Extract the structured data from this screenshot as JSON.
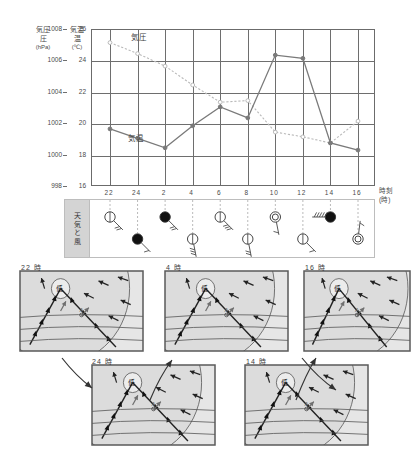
{
  "chart_data": {
    "type": "line",
    "title": "",
    "xlabel": "時刻",
    "xlabel_unit": "(時)",
    "categories": [
      "22",
      "24",
      "2",
      "4",
      "6",
      "8",
      "10",
      "12",
      "14",
      "16"
    ],
    "grid": true,
    "legend": "inline-annotation",
    "axes": [
      {
        "id": "pressure",
        "name": "気圧",
        "unit": "(hPa)",
        "ylim": [
          998,
          1008
        ],
        "ticks": [
          998,
          1000,
          1002,
          1004,
          1006,
          1008
        ],
        "side": "left-outer"
      },
      {
        "id": "temperature",
        "name": "気温",
        "unit": "(℃)",
        "ylim": [
          16,
          26
        ],
        "ticks": [
          16,
          18,
          20,
          22,
          24,
          26
        ],
        "side": "left-inner"
      }
    ],
    "series": [
      {
        "name": "気圧",
        "axis": "pressure",
        "style": "dotted",
        "marker": "open-circle",
        "color": "#b9b9b9",
        "values": [
          1007.2,
          1006.5,
          1005.7,
          1004.5,
          1003.4,
          1003.5,
          1001.5,
          1001.2,
          1000.8,
          1002.2
        ]
      },
      {
        "name": "気温",
        "axis": "temperature",
        "style": "solid",
        "marker": "filled-circle",
        "color": "#7a7a7a",
        "values": [
          19.7,
          19.1,
          18.5,
          19.9,
          21.1,
          20.4,
          24.4,
          24.2,
          18.8,
          18.35
        ]
      }
    ],
    "annotations": [
      {
        "text": "気圧",
        "near_x": "24",
        "position": "upper-left"
      },
      {
        "text": "気温",
        "near_x": "24",
        "position": "lower-left"
      }
    ]
  },
  "weather_band": {
    "label": "天気と風",
    "entries": [
      {
        "time": "22",
        "sky": "clear-circle",
        "sky_glyph": "open-circle",
        "row": "top",
        "wind_barbs": 2,
        "wind_dir": "SE"
      },
      {
        "time": "24",
        "sky": "rain-filled",
        "sky_glyph": "filled-circle",
        "row": "bottom",
        "wind_barbs": 1,
        "wind_dir": "SE"
      },
      {
        "time": "2",
        "sky": "rain-filled",
        "sky_glyph": "filled-circle",
        "row": "top",
        "wind_barbs": 2,
        "wind_dir": "SE"
      },
      {
        "time": "4",
        "sky": "clear-circle",
        "sky_glyph": "open-circle",
        "row": "bottom",
        "wind_barbs": 3,
        "wind_dir": "S"
      },
      {
        "time": "6",
        "sky": "clear-circle",
        "sky_glyph": "open-circle",
        "row": "top",
        "wind_barbs": 3,
        "wind_dir": "SE"
      },
      {
        "time": "8",
        "sky": "clear-circle",
        "sky_glyph": "open-circle",
        "row": "bottom",
        "wind_barbs": 2,
        "wind_dir": "S"
      },
      {
        "time": "10",
        "sky": "cloudy-double",
        "sky_glyph": "double-circle",
        "row": "top",
        "wind_barbs": 1,
        "wind_dir": "S"
      },
      {
        "time": "12",
        "sky": "clear-circle",
        "sky_glyph": "open-circle",
        "row": "bottom",
        "wind_barbs": 1,
        "wind_dir": "SE"
      },
      {
        "time": "14",
        "sky": "rain-filled",
        "sky_glyph": "filled-circle",
        "row": "top",
        "wind_barbs": 5,
        "wind_dir": "W"
      },
      {
        "time": "16",
        "sky": "cloudy-double",
        "sky_glyph": "double-circle",
        "row": "bottom",
        "wind_barbs": 1,
        "wind_dir": "N"
      }
    ]
  },
  "maps": [
    {
      "id": "map-22",
      "caption": "22 時",
      "low_label": "低",
      "point_label": "A"
    },
    {
      "id": "map-24",
      "caption": "24 時",
      "low_label": "低",
      "point_label": "A"
    },
    {
      "id": "map-04",
      "caption": "4 時",
      "low_label": "低",
      "point_label": "A"
    },
    {
      "id": "map-14",
      "caption": "14 時",
      "low_label": "低",
      "point_label": "A"
    },
    {
      "id": "map-16",
      "caption": "16 時",
      "low_label": "低",
      "point_label": "A"
    }
  ],
  "colors": {
    "ink": "#3a3a3a",
    "grid": "#6e6e6e",
    "frame": "#5a5a5a",
    "pressure_line": "#b9b9b9",
    "temperature_line": "#7a7a7a",
    "map_fill": "#e3e3e3",
    "band_label_bg": "#d4d4d4"
  }
}
